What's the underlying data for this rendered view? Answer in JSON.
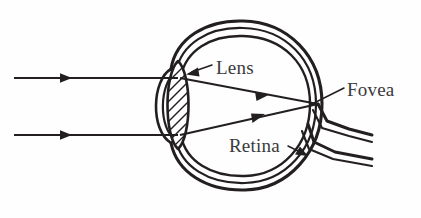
{
  "figure": {
    "background_color": "#fefefe",
    "ink_color": "#231f20",
    "label_color": "#3a3a3c",
    "width": 421,
    "height": 218
  },
  "labels": {
    "lens": "Lens",
    "fovea": "Fovea",
    "retina": "Retina"
  },
  "parts": {
    "eyeball_wall": "eyeball-wall",
    "cornea": "cornea",
    "lens_body": "lens",
    "optic_nerve": "optic-nerve",
    "fovea_point": "fovea-point"
  },
  "rays": {
    "incoming_top": "incoming-light-ray-top",
    "incoming_bottom": "incoming-light-ray-bottom",
    "refracted_top": "refracted-ray-top",
    "refracted_bottom": "refracted-ray-bottom"
  },
  "leaders": {
    "lens": "lens-leader-arrow",
    "fovea": "fovea-leader-line",
    "retina": "retina-leader-arrow"
  }
}
